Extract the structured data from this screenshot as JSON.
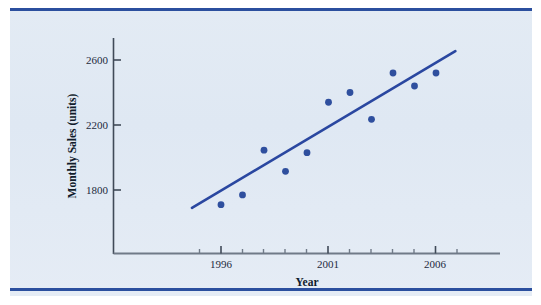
{
  "figure": {
    "panel_background": "#e1e9f3",
    "rule_color": "#2b4f9e",
    "axis_color": "#404a58",
    "series_color": "#2f4f9e",
    "trendline_color": "#2a47a0"
  },
  "chart_data": {
    "type": "scatter",
    "title": "",
    "xlabel": "Year",
    "ylabel": "Monthly Sales (units)",
    "xlim": [
      1994.5,
      2007.5
    ],
    "ylim": [
      1500,
      2720
    ],
    "grid": false,
    "legend": "none",
    "x_tick_labels": [
      "1996",
      "2001",
      "2006"
    ],
    "x_major_ticks": [
      1996,
      2001,
      2006
    ],
    "x_minor_ticks": [
      1995,
      1997,
      1998,
      1999,
      2000,
      2002,
      2003,
      2004,
      2005,
      2007
    ],
    "y_tick_labels": [
      "1800",
      "2200",
      "2600"
    ],
    "y_ticks": [
      1800,
      2200,
      2600
    ],
    "x": [
      1996,
      1997,
      1998,
      1999,
      2000,
      2001,
      2002,
      2003,
      2004,
      2005,
      2006
    ],
    "values": [
      1710,
      1770,
      2045,
      1915,
      2030,
      2340,
      2400,
      2235,
      2520,
      2440,
      2520
    ],
    "series": [
      {
        "name": "Monthly Sales",
        "marker": "circle",
        "color": "#2f4f9e",
        "points": [
          {
            "x": 1996,
            "y": 1710
          },
          {
            "x": 1997,
            "y": 1770
          },
          {
            "x": 1998,
            "y": 2045
          },
          {
            "x": 1999,
            "y": 1915
          },
          {
            "x": 2000,
            "y": 2030
          },
          {
            "x": 2001,
            "y": 2340
          },
          {
            "x": 2002,
            "y": 2400
          },
          {
            "x": 2003,
            "y": 2235
          },
          {
            "x": 2004,
            "y": 2520
          },
          {
            "x": 2005,
            "y": 2440
          },
          {
            "x": 2006,
            "y": 2520
          }
        ]
      }
    ],
    "trendline": {
      "name": "least-squares fit",
      "color": "#2a47a0",
      "x_start": 1994.65,
      "y_start": 1690,
      "x_end": 2006.9,
      "y_end": 2655
    }
  },
  "axis_titles": {
    "x": "Year",
    "y": "Monthly Sales (units)"
  },
  "y_labels": {
    "t0": "1800",
    "t1": "2200",
    "t2": "2600"
  },
  "x_labels": {
    "t0": "1996",
    "t1": "2001",
    "t2": "2006"
  }
}
